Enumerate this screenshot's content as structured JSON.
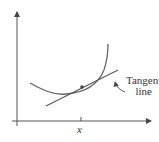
{
  "diagram": {
    "labels": {
      "tangent_line_1": "Tangent",
      "tangent_line_2": "line",
      "x_tick": "x"
    },
    "colors": {
      "stroke": "#555555",
      "text": "#333333",
      "background": "#ffffff"
    }
  }
}
